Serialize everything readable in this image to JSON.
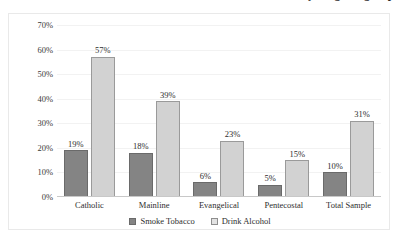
{
  "title": {
    "text": "Use of tobacco and alcohol by religious group",
    "cut_off": true
  },
  "legend": {
    "position": "bottom",
    "items": [
      {
        "label": "Smoke Tobacco",
        "color": "#848484",
        "swatch": "tobacco-swatch"
      },
      {
        "label": "Drink Alcohol",
        "color": "#e2e2e2",
        "swatch": "alcohol-swatch"
      }
    ]
  },
  "axes": {
    "y_ticks": [
      "0%",
      "10%",
      "20%",
      "30%",
      "40%",
      "50%",
      "60%",
      "70%"
    ],
    "x_ticks": [
      "Catholic",
      "Mainline",
      "Evangelical",
      "Pentecostal",
      "Total Sample"
    ]
  },
  "chart_data": {
    "type": "bar",
    "title": "Use of tobacco and alcohol by religious group",
    "xlabel": "",
    "ylabel": "",
    "ylim": [
      0,
      70
    ],
    "ytick_step": 10,
    "ytick_suffix": "%",
    "grid": true,
    "legend_position": "bottom",
    "categories": [
      "Catholic",
      "Mainline",
      "Evangelical",
      "Pentecostal",
      "Total Sample"
    ],
    "series": [
      {
        "name": "Smoke Tobacco",
        "color": "#848484",
        "values": [
          19,
          18,
          6,
          5,
          10
        ],
        "labels": [
          "19%",
          "18%",
          "6%",
          "5%",
          "10%"
        ]
      },
      {
        "name": "Drink Alcohol",
        "color": "#d2d2d2",
        "values": [
          57,
          39,
          23,
          15,
          31
        ],
        "labels": [
          "57%",
          "39%",
          "23%",
          "15%",
          "31%"
        ]
      }
    ]
  }
}
